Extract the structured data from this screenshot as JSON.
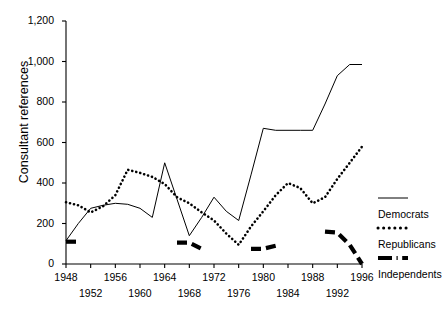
{
  "chart_data": {
    "type": "line",
    "title": "",
    "xlabel": "",
    "ylabel": "Consultant references",
    "xlim": [
      1948,
      1996
    ],
    "ylim": [
      0,
      1200
    ],
    "yticks": [
      "0",
      "200",
      "400",
      "600",
      "800",
      "1,000",
      "1,200"
    ],
    "ytick_values": [
      0,
      200,
      400,
      600,
      800,
      1000,
      1200
    ],
    "xticks_upper": [
      "1948",
      "1956",
      "1964",
      "1972",
      "1980",
      "1988",
      "1996"
    ],
    "xticks_lower": [
      "1952",
      "1960",
      "1968",
      "1976",
      "1984",
      "1992"
    ],
    "xtick_values_upper": [
      1948,
      1956,
      1964,
      1972,
      1980,
      1988,
      1996
    ],
    "xtick_values_lower": [
      1952,
      1960,
      1968,
      1976,
      1984,
      1992
    ],
    "grid": false,
    "legend_position": "right",
    "x": [
      1948,
      1950,
      1952,
      1954,
      1956,
      1958,
      1960,
      1962,
      1964,
      1966,
      1968,
      1970,
      1972,
      1974,
      1976,
      1978,
      1980,
      1982,
      1984,
      1986,
      1988,
      1990,
      1992,
      1994,
      1996
    ],
    "series": [
      {
        "name": "Democrats",
        "style": "solid-line",
        "values": [
          115,
          200,
          275,
          290,
          300,
          295,
          275,
          230,
          500,
          320,
          140,
          230,
          330,
          260,
          215,
          440,
          670,
          660,
          660,
          660,
          660,
          790,
          930,
          985,
          985
        ]
      },
      {
        "name": "Republicans",
        "style": "dotted-line",
        "values": [
          305,
          290,
          255,
          285,
          340,
          465,
          450,
          430,
          395,
          330,
          300,
          255,
          215,
          150,
          95,
          185,
          260,
          340,
          400,
          375,
          300,
          330,
          420,
          500,
          580
        ]
      },
      {
        "name": "Independents",
        "style": "thick-dash-line",
        "values": [
          110,
          110,
          null,
          null,
          null,
          null,
          null,
          null,
          null,
          105,
          105,
          75,
          null,
          null,
          null,
          75,
          75,
          90,
          null,
          null,
          null,
          160,
          155,
          95,
          0
        ]
      }
    ],
    "legend": [
      {
        "label": "Democrats",
        "swatch": "solid-line"
      },
      {
        "label": "Republicans",
        "swatch": "dotted-line"
      },
      {
        "label": "Independents",
        "swatch": "thick-dash-line"
      }
    ]
  },
  "colors": {
    "axis": "#000000",
    "democrats": "#000000",
    "republicans": "#000000",
    "independents": "#000000",
    "background": "#ffffff"
  }
}
